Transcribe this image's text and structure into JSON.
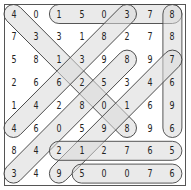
{
  "puzzle": {
    "type": "number-search",
    "rows": 8,
    "cols": 8,
    "grid": [
      [
        "4",
        "0",
        "1",
        "5",
        "0",
        "3",
        "7",
        "8"
      ],
      [
        "7",
        "3",
        "3",
        "1",
        "8",
        "2",
        "7",
        "8"
      ],
      [
        "5",
        "8",
        "1",
        "3",
        "9",
        "8",
        "9",
        "7"
      ],
      [
        "2",
        "6",
        "6",
        "2",
        "5",
        "3",
        "4",
        "6"
      ],
      [
        "1",
        "4",
        "2",
        "8",
        "0",
        "1",
        "6",
        "9"
      ],
      [
        "4",
        "6",
        "0",
        "5",
        "9",
        "8",
        "9",
        "6"
      ],
      [
        "8",
        "4",
        "2",
        "1",
        "2",
        "7",
        "6",
        "5"
      ],
      [
        "3",
        "4",
        "9",
        "5",
        "0",
        "0",
        "7",
        "6"
      ]
    ],
    "found": [
      {
        "sequence": "150378",
        "start": [
          0,
          2
        ],
        "end": [
          0,
          7
        ],
        "direction": "horizontal"
      },
      {
        "sequence": "887696",
        "start": [
          0,
          7
        ],
        "end": [
          5,
          7
        ],
        "direction": "vertical"
      },
      {
        "sequence": "431208",
        "start": [
          0,
          0
        ],
        "end": [
          5,
          5
        ],
        "direction": "diagonal-down-right"
      },
      {
        "sequence": "383644",
        "start": [
          0,
          5
        ],
        "end": [
          5,
          0
        ],
        "direction": "diagonal-down-left"
      },
      {
        "sequence": "858543",
        "start": [
          2,
          5
        ],
        "end": [
          7,
          0
        ],
        "direction": "diagonal-down-left"
      },
      {
        "sequence": "741919",
        "start": [
          2,
          7
        ],
        "end": [
          7,
          2
        ],
        "direction": "diagonal-down-left"
      },
      {
        "sequence": "212765",
        "start": [
          6,
          2
        ],
        "end": [
          6,
          7
        ],
        "direction": "horizontal"
      },
      {
        "sequence": "50076",
        "start": [
          7,
          3
        ],
        "end": [
          7,
          7
        ],
        "direction": "horizontal"
      }
    ],
    "colors": {
      "highlight_fill": "#d8d8d8",
      "highlight_stroke": "#444444",
      "border": "#555555",
      "text": "#222222"
    }
  }
}
